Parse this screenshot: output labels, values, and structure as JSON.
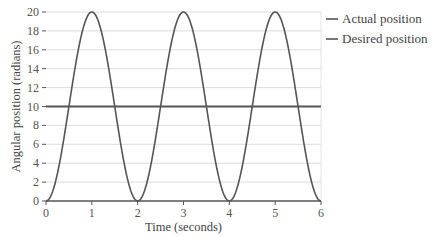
{
  "chart_data": {
    "type": "line",
    "title": "",
    "xlabel": "Time (seconds)",
    "ylabel": "Angular position (radians)",
    "xlim": [
      0,
      6
    ],
    "ylim": [
      0,
      20
    ],
    "x_ticks": [
      0,
      1,
      2,
      3,
      4,
      5,
      6
    ],
    "y_ticks": [
      0,
      2,
      4,
      6,
      8,
      10,
      12,
      14,
      16,
      18,
      20
    ],
    "grid": {
      "horizontal": true,
      "vertical": false
    },
    "legend_position": "right-top",
    "series": [
      {
        "name": "Actual position",
        "color": "#555555",
        "x": [
          0,
          0.5,
          1,
          1.5,
          2,
          2.5,
          3,
          3.5,
          4,
          4.5,
          5,
          5.5,
          6
        ],
        "values": [
          0,
          10,
          20,
          10,
          0,
          10,
          20,
          10,
          0,
          10,
          20,
          10,
          0
        ],
        "shape": "sinusoid: 10 - 10*cos(pi*t)"
      },
      {
        "name": "Desired position",
        "color": "#555555",
        "x": [
          0,
          6
        ],
        "values": [
          10,
          10
        ]
      }
    ]
  },
  "legend": {
    "items": [
      "Actual position",
      "Desired position"
    ]
  }
}
